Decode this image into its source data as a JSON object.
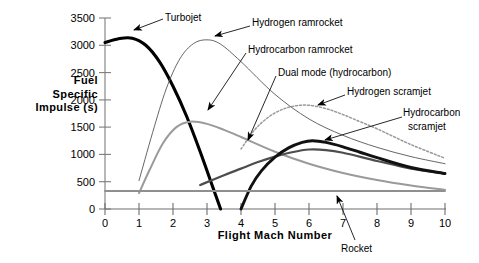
{
  "chart_data": {
    "type": "line",
    "title": "",
    "xlabel": "Flight Mach Number",
    "ylabel": "Fuel Specific Impulse (s)",
    "xlim": [
      0,
      10
    ],
    "ylim": [
      0,
      3500
    ],
    "xticks": [
      "0",
      "1",
      "2",
      "3",
      "4",
      "5",
      "6",
      "7",
      "8",
      "9",
      "10"
    ],
    "yticks": [
      "0",
      "500",
      "1000",
      "1500",
      "2000",
      "2500",
      "3000",
      "3500"
    ],
    "grid": false,
    "legend": "none (inline annotated labels with leader arrows)",
    "series": [
      {
        "name": "Turbojet",
        "style": "thick solid black",
        "color": "#000000",
        "x": [
          0,
          0.4,
          0.8,
          1.2,
          1.6,
          2.0,
          2.4,
          2.8,
          3.2,
          3.4
        ],
        "values": [
          3050,
          3120,
          3130,
          3000,
          2700,
          2250,
          1700,
          1050,
          350,
          0
        ]
      },
      {
        "name": "Hydrogen ramrocket",
        "style": "thin solid black",
        "color": "#555555",
        "x": [
          1.0,
          1.4,
          1.8,
          2.2,
          2.6,
          3.0,
          3.4,
          4.0,
          5.0,
          6.0,
          7.0,
          8.0,
          9.0,
          10.0
        ],
        "values": [
          520,
          1400,
          2200,
          2750,
          3030,
          3100,
          3020,
          2700,
          2100,
          1650,
          1350,
          1130,
          960,
          830
        ]
      },
      {
        "name": "Hydrocarbon ramrocket",
        "style": "medium gray solid",
        "color": "#9a9a9a",
        "x": [
          1.0,
          1.3,
          1.7,
          2.1,
          2.5,
          3.0,
          3.5,
          4.0,
          5.0,
          6.0,
          7.0,
          8.0,
          9.0,
          10.0
        ],
        "values": [
          290,
          700,
          1200,
          1500,
          1600,
          1560,
          1450,
          1320,
          1050,
          830,
          660,
          530,
          430,
          350
        ]
      },
      {
        "name": "Dual mode (hydrocarbon)",
        "style": "dark gray solid",
        "color": "#4d4d4d",
        "x": [
          2.8,
          3.5,
          4.0,
          4.5,
          5.0,
          5.5,
          6.0,
          6.5,
          7.0,
          8.0,
          9.0,
          10.0
        ],
        "values": [
          440,
          620,
          740,
          860,
          960,
          1040,
          1090,
          1080,
          1030,
          880,
          740,
          650
        ]
      },
      {
        "name": "Hydrogen scramjet",
        "style": "dotted gray",
        "color": "#9a9a9a",
        "x": [
          4.0,
          4.4,
          4.8,
          5.2,
          5.6,
          6.0,
          6.5,
          7.0,
          7.5,
          8.0,
          9.0,
          10.0
        ],
        "values": [
          1100,
          1450,
          1680,
          1820,
          1890,
          1900,
          1840,
          1730,
          1600,
          1470,
          1180,
          930
        ]
      },
      {
        "name": "Hydrocarbon scramjet",
        "style": "thick solid black",
        "color": "#111111",
        "x": [
          4.0,
          4.3,
          4.6,
          5.0,
          5.4,
          5.8,
          6.1,
          6.5,
          7.0,
          7.5,
          8.0,
          9.0,
          10.0
        ],
        "values": [
          0,
          420,
          700,
          950,
          1120,
          1220,
          1250,
          1220,
          1140,
          1040,
          940,
          760,
          650
        ]
      },
      {
        "name": "Rocket",
        "style": "flat gray horizontal line",
        "color": "#8f8f8f",
        "x": [
          0,
          10
        ],
        "values": [
          330,
          330
        ]
      }
    ],
    "annotations": [
      {
        "label": "Turbojet",
        "points_to": "Turbojet curve near Mach 1.1"
      },
      {
        "label": "Hydrogen ramrocket",
        "points_to": "Hydrogen ramrocket peak near Mach 3"
      },
      {
        "label": "Hydrocarbon ramrocket",
        "points_to": "Hydrocarbon ramrocket near Mach 3.3"
      },
      {
        "label": "Dual mode (hydrocarbon)",
        "points_to": "Dual mode line near Mach 4.4"
      },
      {
        "label": "Hydrogen scramjet",
        "points_to": "Hydrogen scramjet curve near Mach 5.6"
      },
      {
        "label": "Hydrocarbon scramjet",
        "points_to": "Hydrocarbon scramjet near Mach 6.3"
      },
      {
        "label": "Rocket",
        "points_to": "Rocket flat line near Mach 7.2"
      }
    ]
  },
  "axes": {
    "y_title_lines": [
      "Fuel",
      "Specific",
      "Impulse (s)"
    ],
    "x_title": "Flight Mach Number"
  },
  "labels": {
    "turbojet": "Turbojet",
    "hydrogen_ramrocket": "Hydrogen  ramrocket",
    "hydrocarbon_ramrocket": "Hydrocarbon ramrocket",
    "dual_mode": "Dual mode (hydrocarbon)",
    "hydrogen_scramjet": "Hydrogen scramjet",
    "hydrocarbon_scramjet_l1": "Hydrocarbon",
    "hydrocarbon_scramjet_l2": "scramjet",
    "rocket": "Rocket"
  }
}
